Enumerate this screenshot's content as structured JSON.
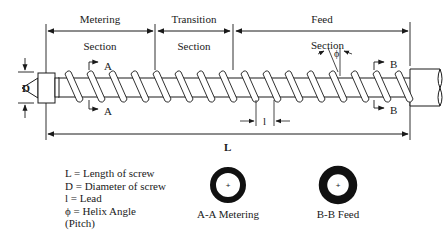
{
  "diagram": {
    "sections": [
      {
        "name": "Metering",
        "sub": "Section",
        "x_start": 46,
        "x_end": 155
      },
      {
        "name": "Transition",
        "sub": "Section",
        "x_start": 155,
        "x_end": 233
      },
      {
        "name": "Feed",
        "sub": "",
        "x_start": 233,
        "x_end": 410
      }
    ],
    "labels": {
      "diameter": "D",
      "length": "L",
      "lead": "l",
      "section_a": "A",
      "section_b": "B",
      "helix_section": "Section",
      "helix_symbol": "ϕ"
    },
    "legend": [
      "L = Length of screw",
      "D = Diameter of screw",
      "l = Lead",
      "ϕ = Helix Angle",
      "(Pitch)"
    ],
    "cross_sections": [
      {
        "label": "A-A Metering",
        "cx": 228,
        "cy": 185,
        "outer_r": 18,
        "inner_r": 12
      },
      {
        "label": "B-B Feed",
        "cx": 338,
        "cy": 185,
        "outer_r": 19,
        "inner_r": 11
      }
    ],
    "colors": {
      "ink": "#1a1a1a",
      "background": "#ffffff"
    }
  }
}
